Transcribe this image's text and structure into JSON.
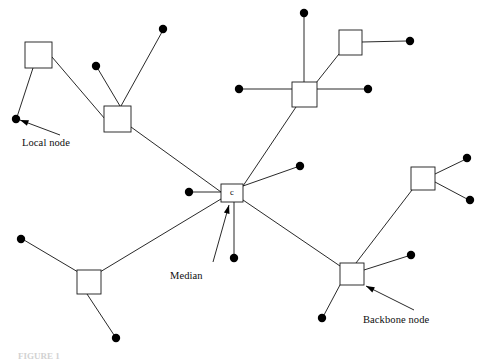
{
  "figure": {
    "width": 487,
    "height": 360,
    "background_color": "#ffffff",
    "line_color": "#111111",
    "node_fill_color": "#000000",
    "square_fill_color": "#ffffff",
    "clipped_caption": "FIGURE 1"
  },
  "center_node": {
    "label": "c",
    "x": 232,
    "y": 193
  },
  "annotations": [
    {
      "key": "local_node",
      "label": "Local node",
      "text_x": 22,
      "text_y": 137,
      "arrow_from_x": 60,
      "arrow_from_y": 135,
      "arrow_to_x": 20,
      "arrow_to_y": 120,
      "points_to": "local-node-dot-upper-left"
    },
    {
      "key": "median",
      "label": "Median",
      "text_x": 170,
      "text_y": 270,
      "arrow_from_x": 213,
      "arrow_from_y": 262,
      "arrow_to_x": 229,
      "arrow_to_y": 205,
      "points_to": "center-median-node"
    },
    {
      "key": "backbone_node",
      "label": "Backbone node",
      "text_x": 363,
      "text_y": 314,
      "arrow_from_x": 414,
      "arrow_from_y": 310,
      "arrow_to_x": 366,
      "arrow_to_y": 286,
      "points_to": "backbone-node-bottom-right"
    }
  ],
  "squares": [
    {
      "key": "square-top-left",
      "name": "backbone-node-top-left",
      "x": 25,
      "y": 42,
      "w": 27,
      "h": 26,
      "label": ""
    },
    {
      "key": "square-upper-mid-left",
      "name": "backbone-node-upper-mid",
      "x": 104,
      "y": 106,
      "w": 27,
      "h": 26,
      "label": ""
    },
    {
      "key": "square-upper-right-hub",
      "name": "backbone-node-upper-right",
      "x": 292,
      "y": 82,
      "w": 25,
      "h": 25,
      "label": ""
    },
    {
      "key": "square-top-right",
      "name": "backbone-node-top-right",
      "x": 339,
      "y": 30,
      "w": 23,
      "h": 25,
      "label": ""
    },
    {
      "key": "square-center",
      "name": "center-median-node",
      "x": 221,
      "y": 184,
      "w": 22,
      "h": 18,
      "label": "c"
    },
    {
      "key": "square-right-mid",
      "name": "backbone-node-right-mid",
      "x": 411,
      "y": 167,
      "w": 24,
      "h": 23,
      "label": ""
    },
    {
      "key": "square-bottom-right",
      "name": "backbone-node-bottom-right",
      "x": 340,
      "y": 263,
      "w": 24,
      "h": 22,
      "label": ""
    },
    {
      "key": "square-bottom-left",
      "name": "backbone-node-bottom-left",
      "x": 77,
      "y": 270,
      "w": 24,
      "h": 24,
      "label": ""
    }
  ],
  "dots": [
    {
      "key": "dot-local-upper-left",
      "name": "local-node-dot-upper-left",
      "cx": 16,
      "cy": 119,
      "r": 4.2
    },
    {
      "key": "dot-upper-mid-a",
      "name": "local-node-dot-upper-mid-a",
      "cx": 96,
      "cy": 66,
      "r": 4.2
    },
    {
      "key": "dot-upper-mid-b",
      "name": "local-node-dot-upper-mid-b",
      "cx": 163,
      "cy": 29,
      "r": 4.2
    },
    {
      "key": "dot-hub-top",
      "name": "local-node-dot-hub-top",
      "cx": 304,
      "cy": 13,
      "r": 4.2
    },
    {
      "key": "dot-hub-left",
      "name": "local-node-dot-hub-left",
      "cx": 239,
      "cy": 89,
      "r": 4.2
    },
    {
      "key": "dot-hub-right",
      "name": "local-node-dot-hub-right",
      "cx": 368,
      "cy": 89,
      "r": 4.2
    },
    {
      "key": "dot-top-right-end",
      "name": "local-node-dot-top-right",
      "cx": 410,
      "cy": 41,
      "r": 4.2
    },
    {
      "key": "dot-center-left",
      "name": "local-node-dot-center-left",
      "cx": 189,
      "cy": 192,
      "r": 4.2
    },
    {
      "key": "dot-center-upper-right",
      "name": "local-node-dot-center-ur",
      "cx": 300,
      "cy": 166,
      "r": 4.2
    },
    {
      "key": "dot-center-below",
      "name": "local-node-dot-center-below",
      "cx": 234,
      "cy": 258,
      "r": 4.2
    },
    {
      "key": "dot-right-mid-upper",
      "name": "local-node-dot-right-upper",
      "cx": 467,
      "cy": 158,
      "r": 4.2
    },
    {
      "key": "dot-right-mid-lower",
      "name": "local-node-dot-right-lower",
      "cx": 470,
      "cy": 200,
      "r": 4.2
    },
    {
      "key": "dot-backbone-right",
      "name": "local-node-dot-backbone-r",
      "cx": 411,
      "cy": 255,
      "r": 4.2
    },
    {
      "key": "dot-backbone-lower",
      "name": "local-node-dot-backbone-low",
      "cx": 322,
      "cy": 318,
      "r": 4.2
    },
    {
      "key": "dot-bottom-left-west",
      "name": "local-node-dot-bl-west",
      "cx": 21,
      "cy": 239,
      "r": 4.2
    },
    {
      "key": "dot-bottom-left-south",
      "name": "local-node-dot-bl-south",
      "cx": 116,
      "cy": 338,
      "r": 4.2
    }
  ],
  "edges": [
    {
      "key": "e-tl-square-to-local",
      "x1": 33,
      "y1": 68,
      "x2": 17,
      "y2": 117
    },
    {
      "key": "e-tl-square-to-umid",
      "x1": 52,
      "y1": 57,
      "x2": 105,
      "y2": 119
    },
    {
      "key": "e-umid-to-dot-a",
      "x1": 120,
      "y1": 106,
      "x2": 98,
      "y2": 69
    },
    {
      "key": "e-umid-to-dot-b",
      "x1": 121,
      "y1": 106,
      "x2": 162,
      "y2": 32
    },
    {
      "key": "e-umid-to-center",
      "x1": 131,
      "y1": 127,
      "x2": 221,
      "y2": 192
    },
    {
      "key": "e-hub-to-top-dot",
      "x1": 304,
      "y1": 82,
      "x2": 304,
      "y2": 16
    },
    {
      "key": "e-hub-to-left-dot",
      "x1": 292,
      "y1": 89,
      "x2": 242,
      "y2": 89
    },
    {
      "key": "e-hub-to-right-dot",
      "x1": 317,
      "y1": 89,
      "x2": 365,
      "y2": 89
    },
    {
      "key": "e-hub-to-topright-sq",
      "x1": 316,
      "y1": 83,
      "x2": 339,
      "y2": 54
    },
    {
      "key": "e-topright-sq-to-dot",
      "x1": 362,
      "y1": 42,
      "x2": 407,
      "y2": 41
    },
    {
      "key": "e-hub-to-center",
      "x1": 296,
      "y1": 107,
      "x2": 243,
      "y2": 186
    },
    {
      "key": "e-center-to-left-dot",
      "x1": 221,
      "y1": 192,
      "x2": 192,
      "y2": 192
    },
    {
      "key": "e-center-to-ur-dot",
      "x1": 243,
      "y1": 186,
      "x2": 297,
      "y2": 167
    },
    {
      "key": "e-center-to-below-dot",
      "x1": 234,
      "y1": 202,
      "x2": 234,
      "y2": 255
    },
    {
      "key": "e-center-to-bl-square",
      "x1": 221,
      "y1": 199,
      "x2": 100,
      "y2": 272
    },
    {
      "key": "e-center-to-backbone",
      "x1": 243,
      "y1": 200,
      "x2": 340,
      "y2": 266
    },
    {
      "key": "e-bl-square-to-west",
      "x1": 78,
      "y1": 272,
      "x2": 24,
      "y2": 240
    },
    {
      "key": "e-bl-square-to-south",
      "x1": 87,
      "y1": 294,
      "x2": 114,
      "y2": 335
    },
    {
      "key": "e-rightmid-to-upper",
      "x1": 435,
      "y1": 174,
      "x2": 464,
      "y2": 160
    },
    {
      "key": "e-rightmid-to-lower",
      "x1": 435,
      "y1": 182,
      "x2": 467,
      "y2": 199
    },
    {
      "key": "e-rightmid-to-backbone",
      "x1": 412,
      "y1": 190,
      "x2": 356,
      "y2": 263
    },
    {
      "key": "e-backbone-to-right",
      "x1": 364,
      "y1": 270,
      "x2": 408,
      "y2": 256
    },
    {
      "key": "e-backbone-to-lower",
      "x1": 340,
      "y1": 285,
      "x2": 324,
      "y2": 315
    }
  ]
}
